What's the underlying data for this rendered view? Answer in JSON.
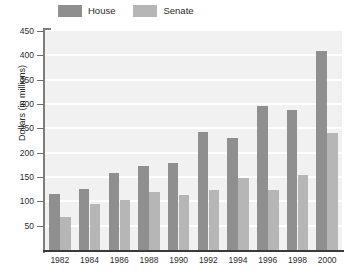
{
  "chart_data": {
    "type": "bar",
    "title": "",
    "subtitle": "",
    "xlabel": "",
    "ylabel": "Dollars (in millions)",
    "ylim": [
      0,
      450
    ],
    "ytick_interval": 50,
    "yticks": [
      450,
      400,
      350,
      300,
      250,
      200,
      150,
      100,
      50
    ],
    "grid": true,
    "legend_position": "top-left",
    "categories": [
      "1982",
      "1984",
      "1986",
      "1988",
      "1990",
      "1992",
      "1994",
      "1996",
      "1998",
      "2000"
    ],
    "series": [
      {
        "name": "House",
        "color": "#8f8f8f",
        "values": [
          115,
          125,
          158,
          172,
          178,
          243,
          230,
          295,
          288,
          408
        ]
      },
      {
        "name": "Senate",
        "color": "#b6b6b6",
        "values": [
          68,
          95,
          102,
          120,
          113,
          123,
          148,
          124,
          155,
          240
        ]
      }
    ]
  },
  "legend": {
    "entries": [
      {
        "label": "House",
        "color": "#8f8f8f"
      },
      {
        "label": "Senate",
        "color": "#b6b6b6"
      }
    ]
  },
  "colors": {
    "plot_background": "#f1f1f1",
    "gridline": "#ffffff",
    "axis": "#3a3a3a",
    "text": "#2b2b2b",
    "house": "#8f8f8f",
    "senate": "#b6b6b6"
  }
}
